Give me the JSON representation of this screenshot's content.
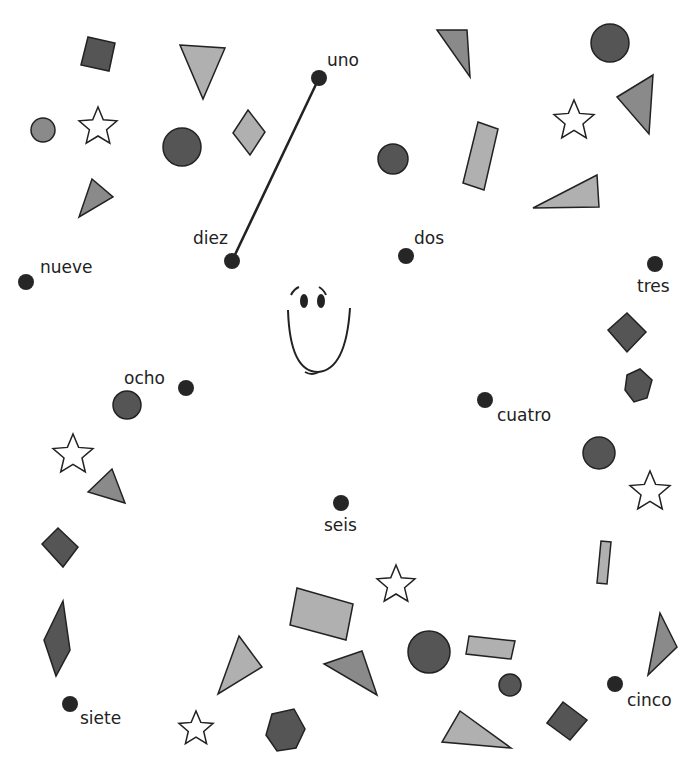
{
  "colors": {
    "dark": "#555555",
    "mid": "#8a8a8a",
    "light": "#b0b0b0",
    "star": "#ffffff",
    "stroke": "#222222",
    "dot": "#262626"
  },
  "dots": [
    {
      "label": "uno",
      "x": 319,
      "y": 78,
      "lx": 327,
      "ly": 50
    },
    {
      "label": "dos",
      "x": 406,
      "y": 256,
      "lx": 414,
      "ly": 228
    },
    {
      "label": "tres",
      "x": 655,
      "y": 264,
      "lx": 637,
      "ly": 276
    },
    {
      "label": "cuatro",
      "x": 485,
      "y": 400,
      "lx": 497,
      "ly": 405
    },
    {
      "label": "cinco",
      "x": 615,
      "y": 684,
      "lx": 627,
      "ly": 690
    },
    {
      "label": "seis",
      "x": 341,
      "y": 503,
      "lx": 324,
      "ly": 515
    },
    {
      "label": "siete",
      "x": 70,
      "y": 704,
      "lx": 80,
      "ly": 708
    },
    {
      "label": "ocho",
      "x": 186,
      "y": 388,
      "lx": 124,
      "ly": 368
    },
    {
      "label": "nueve",
      "x": 26,
      "y": 282,
      "lx": 40,
      "ly": 257
    },
    {
      "label": "diez",
      "x": 232,
      "y": 261,
      "lx": 193,
      "ly": 228
    }
  ],
  "line": {
    "from": "diez",
    "to": "uno"
  },
  "face": {
    "cx": 308,
    "cy": 320
  }
}
